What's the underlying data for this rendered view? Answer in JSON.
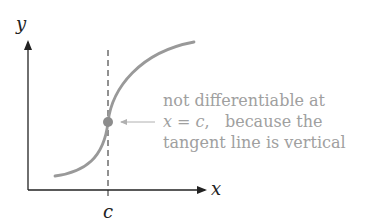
{
  "axes": {
    "y_label": "y",
    "x_label": "x",
    "c_label": "c"
  },
  "annotation": {
    "line1": "not differentiable at",
    "line2_var": "x",
    "line2_eq": " = ",
    "line2_c": "c",
    "line2_rest": ",   because the",
    "line3": "tangent line is vertical"
  },
  "colors": {
    "curve": "#999999",
    "point": "#8c8c8c",
    "axis": "#222222",
    "annotation_text": "#a0a0a0"
  }
}
